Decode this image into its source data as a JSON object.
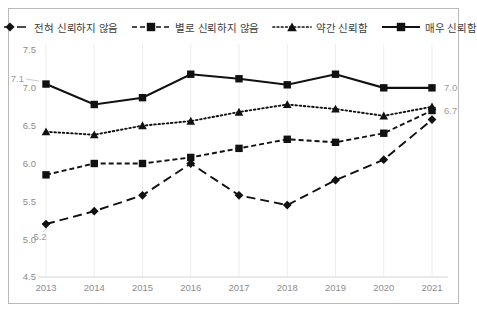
{
  "chart_data": {
    "type": "line",
    "title": "",
    "subtitle": "",
    "xlabel": "",
    "ylabel": "",
    "categories": [
      "2013",
      "2014",
      "2015",
      "2016",
      "2017",
      "2018",
      "2019",
      "2020",
      "2021"
    ],
    "ylim": [
      4.5,
      7.5
    ],
    "ytick_labels": [
      "7.5",
      "7.0",
      "6.5",
      "6.0",
      "5.5",
      "5.0",
      "4.5"
    ],
    "ytick_values": [
      7.5,
      7.0,
      6.5,
      6.0,
      5.5,
      5.0,
      4.5
    ],
    "grid": "vertical",
    "legend_position": "top",
    "series": [
      {
        "name": "전혀 신뢰하지 않음",
        "marker": "diamond",
        "linestyle": "long-dash",
        "color": "#111111",
        "values": [
          5.2,
          5.37,
          5.58,
          6.0,
          5.58,
          5.45,
          5.78,
          6.05,
          6.58
        ]
      },
      {
        "name": "별로 신뢰하지 않음",
        "marker": "square",
        "linestyle": "short-dash",
        "color": "#111111",
        "values": [
          5.85,
          6.0,
          6.0,
          6.08,
          6.2,
          6.32,
          6.28,
          6.4,
          6.7
        ]
      },
      {
        "name": "약간 신뢰함",
        "marker": "triangle",
        "linestyle": "dotted",
        "color": "#111111",
        "values": [
          6.42,
          6.38,
          6.5,
          6.56,
          6.68,
          6.78,
          6.72,
          6.63,
          6.75
        ]
      },
      {
        "name": "매우 신뢰함",
        "marker": "square",
        "linestyle": "solid",
        "color": "#111111",
        "values": [
          7.05,
          6.78,
          6.87,
          7.18,
          7.12,
          7.04,
          7.18,
          7.0,
          7.0
        ]
      }
    ],
    "annotations": [
      {
        "text": "7.1",
        "series": "매우 신뢰함",
        "category": "2013",
        "position": "left"
      },
      {
        "text": "5.2",
        "series": "전혀 신뢰하지 않음",
        "category": "2013",
        "position": "below-left"
      },
      {
        "text": "7.0",
        "series": "매우 신뢰함",
        "category": "2021",
        "position": "right"
      },
      {
        "text": "6.7",
        "series": "별로 신뢰하지 않음",
        "category": "2021",
        "position": "right"
      }
    ]
  },
  "legend": {
    "entries": [
      {
        "label": "전혀 신뢰하지 않음"
      },
      {
        "label": "별로 신뢰하지 않음"
      },
      {
        "label": "약간 신뢰함"
      },
      {
        "label": "매우 신뢰함"
      }
    ]
  },
  "colors": {
    "line": "#111111",
    "grid": "#ededed",
    "border": "#b9b9b9",
    "tick_text": "#8d8d8d",
    "label_text": "#9a9a9a",
    "background": "#ffffff"
  }
}
